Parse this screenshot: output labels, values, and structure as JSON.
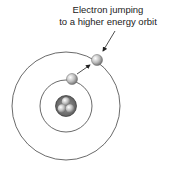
{
  "annotation": {
    "line1": "Electron jumping",
    "line2": "to a higher energy orbit"
  },
  "diagram": {
    "type": "bohr-atom",
    "orbits": 2,
    "nucleus_particles": 3,
    "electrons": [
      "inner-orbit electron",
      "outer-orbit electron"
    ]
  }
}
